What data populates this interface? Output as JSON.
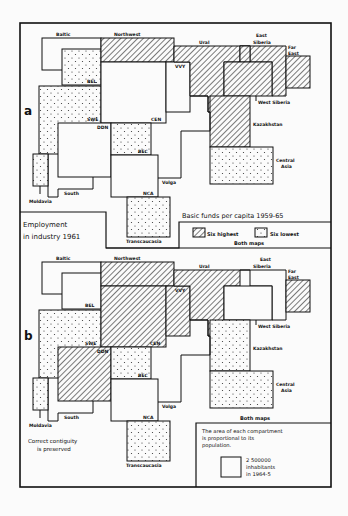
{
  "figure": {
    "panel_a_label": "a",
    "panel_b_label": "b",
    "employment_title_line1": "Employment",
    "employment_title_line2": "in industry 1961",
    "basic_funds_title": "Basic funds per capita  1959-65",
    "legend": {
      "six_highest": "Six highest",
      "six_lowest": "Six lowest",
      "both_maps": "Both maps"
    },
    "both_maps_b": "Both maps",
    "contiguity_line1": "Correct contiguity",
    "contiguity_line2": "is preserved",
    "area_note_line1": "The area of each compartment",
    "area_note_line2": "is proportional  to its",
    "area_note_line3": "population.",
    "scale_line1": "2 500000",
    "scale_line2": "inhabitants",
    "scale_line3": "in 1964-5"
  },
  "regions": {
    "baltic": "Baltic",
    "northwest": "Northwest",
    "ural": "Ural",
    "east_siberia_1": "East",
    "east_siberia_2": "Siberia",
    "far_east_1": "Far",
    "far_east_2": "East",
    "vvy": "VVY",
    "bel": "BEL",
    "swe": "SWE",
    "cen": "CEN",
    "ddn": "DDN",
    "bec": "BEC",
    "west_siberia": "West Siberia",
    "kazakhstan": "Kazakhstan",
    "central_asia_1": "Central",
    "central_asia_2": "Asia",
    "volga": "Volga",
    "south": "South",
    "moldavia": "Moldavia",
    "nca": "NCA",
    "transcaucasia": "Transcaucasia"
  },
  "colors": {
    "ink": "#111111",
    "paper": "#fbfbfb"
  }
}
